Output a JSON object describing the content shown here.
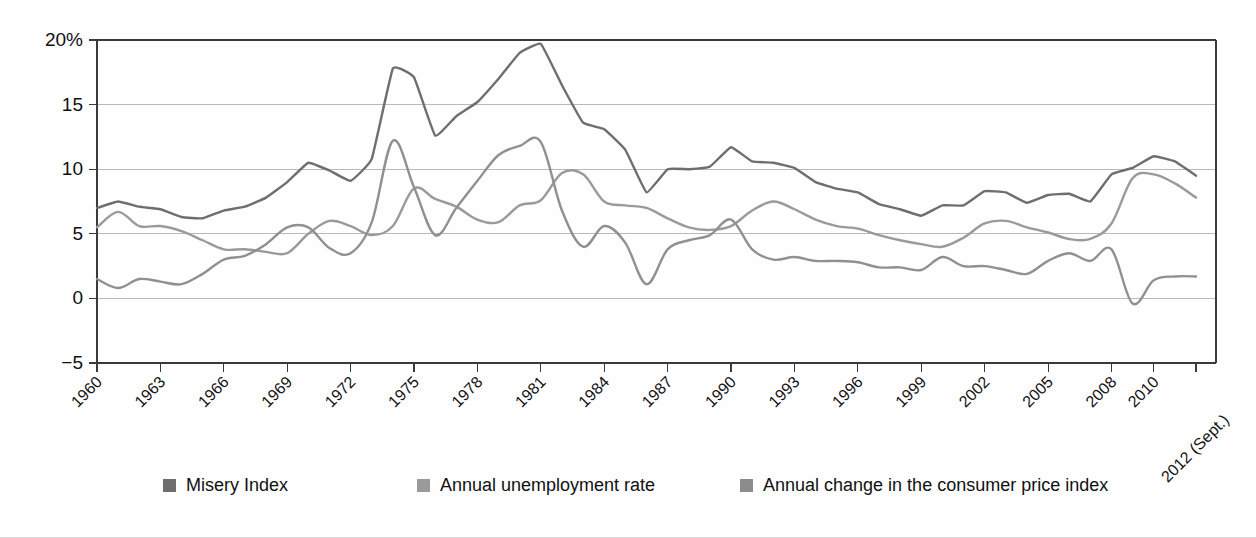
{
  "chart_data": {
    "type": "line",
    "title": "",
    "subtitle": "",
    "xlabel": "",
    "ylabel": "",
    "grid": true,
    "legend_position": "bottom",
    "ylim": [
      -5,
      20
    ],
    "ytick_values": [
      -5,
      0,
      5,
      10,
      15,
      20
    ],
    "ytick_labels": [
      "−5",
      "0",
      "5",
      "10",
      "15",
      "20%"
    ],
    "xlim": [
      1960,
      2012
    ],
    "xtick_values": [
      1960,
      1963,
      1966,
      1969,
      1972,
      1975,
      1978,
      1981,
      1984,
      1987,
      1990,
      1993,
      1996,
      1999,
      2002,
      2005,
      2008,
      2010,
      2012
    ],
    "xtick_labels": [
      "1960",
      "1963",
      "1966",
      "1969",
      "1972",
      "1975",
      "1978",
      "1981",
      "1984",
      "1987",
      "1990",
      "1993",
      "1996",
      "1999",
      "2002",
      "2005",
      "2008",
      "2010",
      "2012 (Sept.)"
    ],
    "x": [
      1960,
      1961,
      1962,
      1963,
      1964,
      1965,
      1966,
      1967,
      1968,
      1969,
      1970,
      1971,
      1972,
      1973,
      1974,
      1975,
      1976,
      1977,
      1978,
      1979,
      1980,
      1981,
      1982,
      1983,
      1984,
      1985,
      1986,
      1987,
      1988,
      1989,
      1990,
      1991,
      1992,
      1993,
      1994,
      1995,
      1996,
      1997,
      1998,
      1999,
      2000,
      2001,
      2002,
      2003,
      2004,
      2005,
      2006,
      2007,
      2008,
      2009,
      2010,
      2011,
      2012
    ],
    "series": [
      {
        "name": "Misery Index",
        "color": "#6e6e6e",
        "values": [
          7.0,
          7.5,
          7.1,
          6.9,
          6.3,
          6.2,
          6.8,
          7.1,
          7.8,
          9.0,
          10.5,
          9.9,
          9.1,
          10.8,
          17.8,
          17.1,
          12.6,
          14.1,
          15.2,
          17.0,
          19.0,
          19.7,
          16.5,
          13.6,
          13.1,
          11.5,
          8.2,
          10.0,
          10.0,
          10.2,
          11.7,
          10.6,
          10.5,
          10.1,
          9.0,
          8.5,
          8.2,
          7.3,
          6.9,
          6.4,
          7.2,
          7.2,
          8.3,
          8.2,
          7.4,
          8.0,
          8.1,
          7.5,
          9.6,
          10.1,
          11.0,
          10.6,
          9.5
        ]
      },
      {
        "name": "Annual unemployment rate",
        "color": "#9a9a9a",
        "values": [
          5.5,
          6.7,
          5.6,
          5.6,
          5.2,
          4.5,
          3.8,
          3.8,
          3.6,
          3.5,
          5.0,
          6.0,
          5.6,
          4.9,
          5.6,
          8.5,
          7.7,
          7.1,
          6.1,
          5.9,
          7.2,
          7.6,
          9.7,
          9.6,
          7.5,
          7.2,
          7.0,
          6.2,
          5.5,
          5.3,
          5.6,
          6.8,
          7.5,
          6.9,
          6.1,
          5.6,
          5.4,
          4.9,
          4.5,
          4.2,
          4.0,
          4.7,
          5.8,
          6.0,
          5.5,
          5.1,
          4.6,
          4.6,
          5.8,
          9.3,
          9.6,
          8.9,
          7.8
        ]
      },
      {
        "name": "Annual change in the consumer price index",
        "color": "#909090",
        "values": [
          1.5,
          0.8,
          1.5,
          1.3,
          1.1,
          1.9,
          3.0,
          3.3,
          4.2,
          5.5,
          5.5,
          3.9,
          3.5,
          5.9,
          12.2,
          8.6,
          4.9,
          7.0,
          9.1,
          11.1,
          11.8,
          12.1,
          6.8,
          4.0,
          5.6,
          4.3,
          1.1,
          3.8,
          4.5,
          4.9,
          6.1,
          3.8,
          3.0,
          3.2,
          2.9,
          2.9,
          2.8,
          2.4,
          2.4,
          2.2,
          3.2,
          2.5,
          2.5,
          2.2,
          1.9,
          2.9,
          3.5,
          2.9,
          3.8,
          -0.4,
          1.4,
          1.7,
          1.7
        ]
      }
    ]
  },
  "legend": {
    "items": [
      {
        "label": "Misery Index",
        "color": "#6e6e6e"
      },
      {
        "label": "Annual unemployment rate",
        "color": "#9a9a9a"
      },
      {
        "label": "Annual change in the consumer price index",
        "color": "#8c8c8c"
      }
    ]
  }
}
